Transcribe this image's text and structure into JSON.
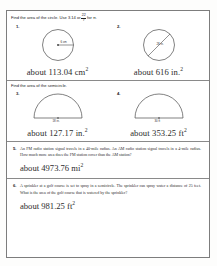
{
  "header": {
    "title": "4.3  Record and Practice Journal"
  },
  "sections": [
    {
      "instruction_prefix": "Find the area of the circle. Use 3.14 or",
      "fraction_numerator": "22",
      "fraction_denominator": "7",
      "instruction_suffix": "for π.",
      "problems": [
        {
          "number": "1.",
          "shape": "circle-radius",
          "dimension_label": "6 cm",
          "answer_text": "about 113.04 cm",
          "answer_exponent": "2"
        },
        {
          "number": "2.",
          "shape": "circle-diameter",
          "dimension_label": "28 in.",
          "answer_text": "about 616 in.",
          "answer_exponent": "2"
        }
      ]
    },
    {
      "instruction_prefix": "Find the area of the semicircle.",
      "problems": [
        {
          "number": "3.",
          "shape": "semicircle",
          "dimension_label": "18 in.",
          "answer_text": "about 127.17 in.",
          "answer_exponent": "2"
        },
        {
          "number": "4.",
          "shape": "semicircle",
          "dimension_label": "30 ft",
          "answer_text": "about 353.25 ft",
          "answer_exponent": "2"
        }
      ]
    }
  ],
  "word_problems": [
    {
      "number": "5.",
      "text": "An FM radio station signal travels in a 40-mile radius. An AM radio station signal travels in a 4-mile radius. How much more area does the FM station cover than the AM station?",
      "answer_text": "about 4973.76 mi",
      "answer_exponent": "2"
    },
    {
      "number": "6.",
      "text": "A sprinkler at a golf course is set to spray in a semicircle. The sprinkler can spray water a distance of 25 feet. What is the area of the golf course that is watered by the sprinkler?",
      "answer_text": "about 981.25 ft",
      "answer_exponent": "2"
    }
  ],
  "colors": {
    "border": "#7d7d7d",
    "ink": "#2b2b2b",
    "paper": "#ffffff"
  }
}
